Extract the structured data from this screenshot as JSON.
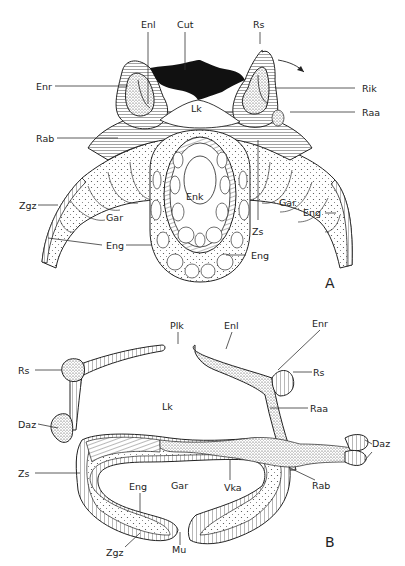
{
  "figure": {
    "panels": [
      {
        "id": "A",
        "panel_label": "A",
        "labels": {
          "enl": "Enl",
          "cut": "Cut",
          "rs": "Rs",
          "enr": "Enr",
          "rik": "Rik",
          "lk": "Lk",
          "raa": "Raa",
          "rab": "Rab",
          "enk": "Enk",
          "zgz": "Zgz",
          "gar_left": "Gar",
          "gar_right": "Gar",
          "zs": "Zs",
          "eng_right": "Eng",
          "eng_left": "Eng",
          "eng_bottom": "Eng"
        }
      },
      {
        "id": "B",
        "panel_label": "B",
        "labels": {
          "plk": "Plk",
          "enl": "Enl",
          "enr": "Enr",
          "rs_left": "Rs",
          "rs_right": "Rs",
          "lk": "Lk",
          "raa": "Raa",
          "daz_left": "Daz",
          "daz_right": "Daz",
          "zs": "Zs",
          "eng": "Eng",
          "gar": "Gar",
          "vka": "Vka",
          "rab": "Rab",
          "zgz": "Zgz",
          "mu": "Mu"
        }
      }
    ],
    "colors": {
      "ink": "#222222",
      "cuticle": "#111111",
      "background": "#ffffff",
      "stipple": "#f0f0f0"
    }
  }
}
